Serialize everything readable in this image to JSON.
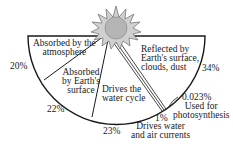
{
  "diagram": {
    "title": "",
    "segments": [
      {
        "label_lines": [
          "Absorbed by the",
          "atmosphere"
        ],
        "percent": "20%"
      },
      {
        "label_lines": [
          "Absorbed",
          "by Earth's",
          "surface"
        ],
        "percent": "22%"
      },
      {
        "label_lines": [
          "Drives the",
          "water cycle"
        ],
        "percent": "23%"
      },
      {
        "label_lines": [
          "Drives water",
          "and air currents"
        ],
        "percent": "1%"
      },
      {
        "label_lines": [
          "Used for",
          "photosynthesis"
        ],
        "percent": "0.023%"
      },
      {
        "label_lines": [
          "Reflected by",
          "Earth's surface,",
          "clouds, dust"
        ],
        "percent": "34%"
      }
    ],
    "colors": {
      "sun_fill": "#b5b5b5",
      "line": "#1a1a1a",
      "background": "#ffffff"
    }
  }
}
